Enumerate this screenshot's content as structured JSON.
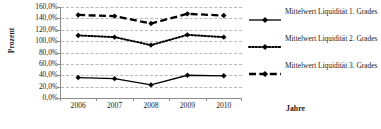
{
  "chart_data": {
    "type": "line",
    "title": "",
    "xlabel": "Jahre",
    "ylabel": "Prozent",
    "categories": [
      "2006",
      "2007",
      "2008",
      "2009",
      "2010"
    ],
    "ylim": [
      0,
      160
    ],
    "ytick_step": 20,
    "ytick_labels": [
      "160,0%",
      "140,0%",
      "120,0%",
      "100,0%",
      "80,0%",
      "60,0%",
      "40,0%",
      "20,0%",
      "0,0%"
    ],
    "ytick_values": [
      160,
      140,
      120,
      100,
      80,
      60,
      40,
      20,
      0
    ],
    "grid": true,
    "grid_axis": "y",
    "legend_position": "right",
    "series": [
      {
        "name": "Mittelwert Liquidität 1. Grades",
        "line_style": "solid",
        "color": "#000000",
        "marker": "diamond",
        "values": [
          36,
          34,
          23,
          40,
          39
        ]
      },
      {
        "name": "Mittelwert Liquidität 2. Grades",
        "line_style": "dotted",
        "color": "#000000",
        "marker": "diamond",
        "values": [
          110,
          107,
          93,
          111,
          107
        ]
      },
      {
        "name": "Mittelwert Liquidität 3. Grades",
        "line_style": "dashed",
        "color": "#000000",
        "marker": "diamond",
        "values": [
          146,
          144,
          131,
          148,
          145
        ]
      }
    ]
  },
  "legend": {
    "entries": [
      "Mittelwert Liquidität 1. Grades",
      "Mittelwert Liquidität 2. Grades",
      "Mittelwert Liquidität 3. Grades"
    ]
  }
}
